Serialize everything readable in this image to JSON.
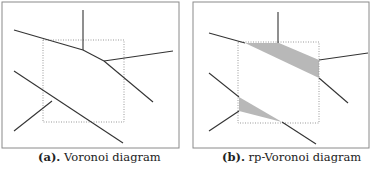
{
  "figures": [
    {
      "id": "a",
      "label": "(a).",
      "caption": "Voronoi diagram",
      "frame": {
        "x": 2,
        "y": 2,
        "w": 177,
        "h": 146
      },
      "window": {
        "x": 43,
        "y": 40,
        "w": 81,
        "h": 82
      },
      "edges": [
        [
          [
            83,
            10
          ],
          [
            83,
            50
          ]
        ],
        [
          [
            14,
            30
          ],
          [
            83,
            50
          ]
        ],
        [
          [
            83,
            50
          ],
          [
            104,
            61
          ]
        ],
        [
          [
            104,
            61
          ],
          [
            173,
            51
          ]
        ],
        [
          [
            104,
            61
          ],
          [
            153,
            102
          ]
        ],
        [
          [
            14,
            71
          ],
          [
            123,
            143
          ]
        ],
        [
          [
            52,
            101
          ],
          [
            14,
            131
          ]
        ]
      ],
      "shaded": []
    },
    {
      "id": "b",
      "label": "(b).",
      "caption": "rp-Voronoi diagram",
      "frame": {
        "x": 193,
        "y": 2,
        "w": 176,
        "h": 146
      },
      "window": {
        "x": 238,
        "y": 42,
        "w": 81,
        "h": 81
      },
      "edges": [
        [
          [
            278,
            12
          ],
          [
            278,
            43
          ]
        ],
        [
          [
            209,
            33
          ],
          [
            245,
            43
          ]
        ],
        [
          [
            319,
            60
          ],
          [
            368,
            53
          ]
        ],
        [
          [
            319,
            78
          ],
          [
            348,
            103
          ]
        ],
        [
          [
            209,
            73
          ],
          [
            239,
            97
          ]
        ],
        [
          [
            239,
            111
          ],
          [
            209,
            131
          ]
        ],
        [
          [
            282,
            122
          ],
          [
            316,
            144
          ]
        ]
      ],
      "shaded": [
        [
          [
            245,
            43
          ],
          [
            279,
            43
          ],
          [
            319,
            60
          ],
          [
            319,
            78
          ]
        ],
        [
          [
            239,
            97
          ],
          [
            239,
            111
          ],
          [
            282,
            122
          ]
        ]
      ]
    }
  ],
  "colors": {
    "edge": "#333333",
    "frame": "#8a8a8a",
    "window": "#999999",
    "shade": "#b8b8b8"
  }
}
